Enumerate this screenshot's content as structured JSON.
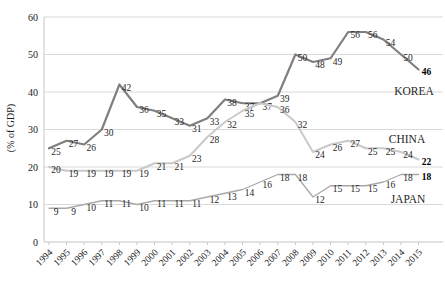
{
  "chart_data": {
    "type": "line",
    "title": "",
    "xlabel": "",
    "ylabel": "(% of GDP)",
    "ylim": [
      0,
      60
    ],
    "ytick_step": 10,
    "grid": true,
    "legend_position": "inline-right-of-lines",
    "categories": [
      "1994",
      "1995",
      "1996",
      "1997",
      "1998",
      "1999",
      "2000",
      "2001",
      "2002",
      "2003",
      "2004",
      "2005",
      "2006",
      "2007",
      "2008",
      "2009",
      "2010",
      "2011",
      "2012",
      "2013",
      "2014",
      "2015"
    ],
    "series": [
      {
        "name": "KOREA",
        "color": "#7f7f7f",
        "stroke_width": 2.2,
        "name_pos": [
          414,
          91
        ],
        "label_skip": [],
        "values": [
          25,
          27,
          26,
          30,
          42,
          36,
          35,
          33,
          31,
          33,
          38,
          37,
          37,
          39,
          50,
          48,
          49,
          56,
          56,
          54,
          50,
          46
        ]
      },
      {
        "name": "CHINA",
        "color": "#c9c9c9",
        "stroke_width": 2.0,
        "name_pos": [
          407,
          139
        ],
        "label_skip": [
          12
        ],
        "values": [
          20,
          19,
          19,
          19,
          19,
          19,
          21,
          21,
          23,
          28,
          32,
          35,
          37,
          36,
          32,
          24,
          26,
          27,
          25,
          25,
          24,
          22
        ]
      },
      {
        "name": "JAPAN",
        "color": "#a8a8a8",
        "stroke_width": 1.3,
        "name_pos": [
          408,
          199
        ],
        "label_skip": [],
        "values": [
          9,
          9,
          10,
          11,
          11,
          10,
          11,
          11,
          11,
          12,
          13,
          14,
          16,
          18,
          18,
          12,
          15,
          15,
          15,
          16,
          18,
          18
        ]
      }
    ]
  },
  "colors": {
    "gridline": "#d9d9d9",
    "axis_line": "#c6c6c6",
    "tick_text": "#1a1a1a",
    "data_label": "#262626",
    "final_label": "#000000",
    "background": "#ffffff"
  }
}
